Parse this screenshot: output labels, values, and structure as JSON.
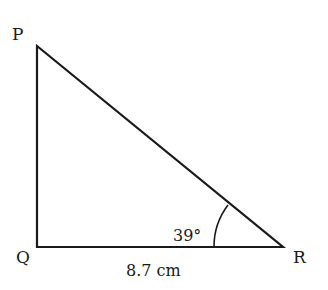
{
  "diagram": {
    "type": "right-triangle",
    "vertices": {
      "P": {
        "label": "P"
      },
      "Q": {
        "label": "Q"
      },
      "R": {
        "label": "R"
      }
    },
    "angle_R": "39°",
    "side_QR": "8.7 cm",
    "stroke_color": "#1a1a1a"
  }
}
